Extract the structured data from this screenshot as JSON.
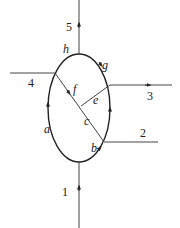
{
  "diagram": {
    "type": "flow-network",
    "colors": {
      "line": "#444444",
      "loop": "#222222",
      "label": "#222222",
      "background": "#ffffff"
    },
    "loop": {
      "center": [
        79,
        108
      ],
      "rx": 31,
      "ry": 54,
      "segment_labels": {
        "a": {
          "text": "a",
          "pos": [
            44,
            133
          ]
        },
        "b": {
          "text": "b",
          "pos": [
            91,
            152
          ]
        },
        "g": {
          "text": "g",
          "pos": [
            102,
            69
          ]
        },
        "h": {
          "text": "h",
          "pos": [
            63,
            53
          ]
        }
      }
    },
    "branches": [
      {
        "id": "1",
        "label": "1",
        "label_pos": [
          62,
          196
        ],
        "from": [
          79,
          228
        ],
        "to": [
          79,
          162
        ],
        "direction": "in"
      },
      {
        "id": "2",
        "label": "2",
        "label_pos": [
          140,
          137
        ],
        "from": [
          104,
          142
        ],
        "to": [
          158,
          142
        ],
        "direction": "none"
      },
      {
        "id": "3",
        "label": "3",
        "label_pos": [
          147,
          100
        ],
        "from": [
          110,
          85
        ],
        "to": [
          172,
          85
        ],
        "direction": "out"
      },
      {
        "id": "4",
        "label": "4",
        "label_pos": [
          28,
          87
        ],
        "from": [
          10,
          73
        ],
        "to": [
          55,
          73
        ],
        "direction": "none"
      },
      {
        "id": "5",
        "label": "5",
        "label_pos": [
          66,
          31
        ],
        "from": [
          79,
          54
        ],
        "to": [
          79,
          0
        ],
        "direction": "out"
      }
    ],
    "internal": [
      {
        "id": "chord",
        "from": [
          55,
          73
        ],
        "to": [
          104,
          142
        ],
        "labels": [
          "f",
          "c"
        ]
      },
      {
        "id": "e",
        "from": [
          110,
          85
        ],
        "to": [
          81,
          106
        ],
        "labels": [
          "e"
        ]
      }
    ],
    "internal_labels": {
      "f": {
        "text": "f",
        "pos": [
          73,
          93
        ]
      },
      "e": {
        "text": "e",
        "pos": [
          93,
          104
        ]
      },
      "c": {
        "text": "c",
        "pos": [
          84,
          125
        ]
      }
    }
  }
}
